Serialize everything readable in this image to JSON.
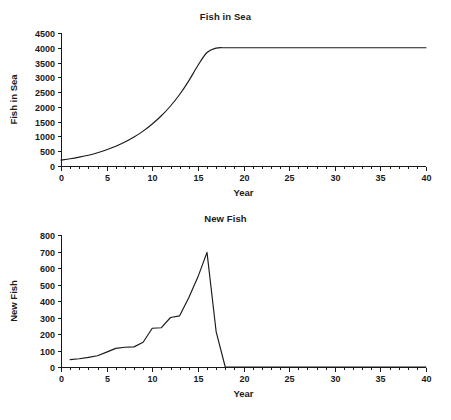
{
  "page": {
    "background": "#ffffff",
    "ink": "#1a1a1a",
    "header_ghost": ""
  },
  "charts": [
    {
      "id": "fish-in-sea",
      "title": "Fish in Sea",
      "xlabel": "Year",
      "ylabel": "Fish in Sea"
    },
    {
      "id": "new-fish",
      "title": "New Fish",
      "xlabel": "Year",
      "ylabel": "New Fish"
    }
  ],
  "chart_data": [
    {
      "type": "line",
      "id": "fish-in-sea",
      "title": "Fish in Sea",
      "xlabel": "Year",
      "ylabel": "Fish in Sea",
      "xlim": [
        0,
        40
      ],
      "ylim": [
        0,
        4500
      ],
      "xticks": [
        0,
        5,
        10,
        15,
        20,
        25,
        30,
        35,
        40
      ],
      "xticklabels": [
        "0",
        "5",
        "10",
        "15",
        "20",
        "25",
        "30",
        "35",
        "40"
      ],
      "xminor_step": 1,
      "yticks": [
        0,
        500,
        1000,
        1500,
        2000,
        2500,
        3000,
        3500,
        4000,
        4500
      ],
      "yticklabels": [
        "0",
        "500",
        "1000",
        "1500",
        "2000",
        "2500",
        "3000",
        "3500",
        "4000",
        "4500"
      ],
      "grid": false,
      "legend": false,
      "line_color": "#1a1a1a",
      "series": [
        {
          "name": "Fish in Sea",
          "x": [
            0,
            1,
            2,
            3,
            4,
            5,
            6,
            7,
            8,
            9,
            10,
            11,
            12,
            13,
            14,
            15,
            16,
            17,
            18,
            19,
            20,
            25,
            30,
            35,
            40
          ],
          "values": [
            200,
            245,
            300,
            365,
            450,
            550,
            670,
            810,
            980,
            1180,
            1420,
            1700,
            2030,
            2420,
            2880,
            3400,
            3840,
            3990,
            4000,
            4000,
            4000,
            4000,
            4000,
            4000,
            4000
          ]
        }
      ]
    },
    {
      "type": "line",
      "id": "new-fish",
      "title": "New Fish",
      "xlabel": "Year",
      "ylabel": "New Fish",
      "xlim": [
        0,
        40
      ],
      "ylim": [
        0,
        800
      ],
      "xticks": [
        0,
        5,
        10,
        15,
        20,
        25,
        30,
        35,
        40
      ],
      "xticklabels": [
        "0",
        "5",
        "10",
        "15",
        "20",
        "25",
        "30",
        "35",
        "40"
      ],
      "xminor_step": 1,
      "yticks": [
        0,
        100,
        200,
        300,
        400,
        500,
        600,
        700,
        800
      ],
      "yticklabels": [
        "0",
        "100",
        "200",
        "300",
        "400",
        "500",
        "600",
        "700",
        "800"
      ],
      "grid": false,
      "legend": false,
      "line_color": "#1a1a1a",
      "series": [
        {
          "name": "New Fish",
          "x": [
            1,
            2,
            3,
            4,
            5,
            6,
            7,
            8,
            9,
            10,
            11,
            12,
            13,
            14,
            15,
            16,
            17,
            18,
            19,
            20,
            25,
            30,
            35,
            40
          ],
          "values": [
            45,
            50,
            58,
            68,
            90,
            113,
            120,
            122,
            150,
            235,
            238,
            300,
            310,
            420,
            545,
            695,
            215,
            0,
            0,
            0,
            0,
            0,
            0,
            0
          ]
        }
      ]
    }
  ]
}
